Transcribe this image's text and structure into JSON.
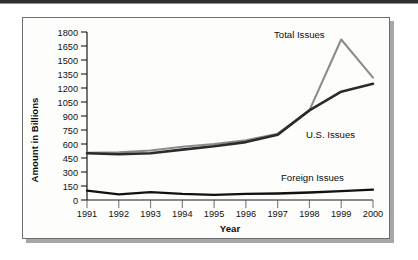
{
  "chart_data": {
    "type": "line",
    "title": "",
    "xlabel": "Year",
    "ylabel": "Amount in Billions",
    "categories": [
      "1991",
      "1992",
      "1993",
      "1994",
      "1995",
      "1996",
      "1997",
      "1998",
      "1999",
      "2000"
    ],
    "x": [
      1991,
      1992,
      1993,
      1994,
      1995,
      1996,
      1997,
      1998,
      1999,
      2000
    ],
    "xlim": [
      1991,
      2000
    ],
    "ylim": [
      0,
      1800
    ],
    "yticks": [
      0,
      150,
      300,
      450,
      600,
      750,
      900,
      1050,
      1200,
      1350,
      1500,
      1650,
      1800
    ],
    "ytick_labels": [
      "0",
      "150",
      "300",
      "450",
      "600",
      "750",
      "900",
      "1050",
      "1200",
      "1350",
      "1500",
      "1650",
      "1800"
    ],
    "grid": false,
    "legend_position": "inline-annotations",
    "series": [
      {
        "name": "Total Issues",
        "color": "#8c8c8c",
        "values": [
          505,
          510,
          530,
          570,
          600,
          640,
          710,
          960,
          1720,
          1310
        ]
      },
      {
        "name": "U.S. Issues",
        "color": "#2b2b2b",
        "values": [
          500,
          490,
          500,
          540,
          575,
          620,
          700,
          960,
          1160,
          1245
        ]
      },
      {
        "name": "Foreign Issues",
        "color": "#101010",
        "values": [
          100,
          60,
          85,
          65,
          55,
          65,
          70,
          80,
          95,
          110
        ]
      }
    ],
    "annotations": [
      {
        "text": "Total Issues",
        "series": "Total Issues"
      },
      {
        "text": "U.S. Issues",
        "series": "U.S. Issues"
      },
      {
        "text": "Foreign Issues",
        "series": "Foreign Issues"
      }
    ]
  }
}
